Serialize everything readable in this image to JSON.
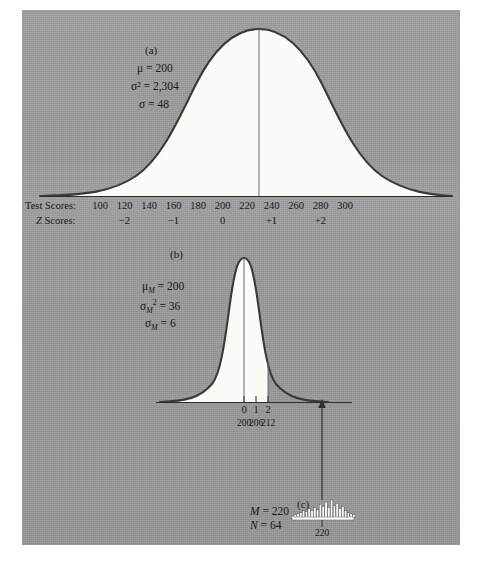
{
  "figure": {
    "background_color": "#9b9b9b",
    "curve_color": "#3a3a3a",
    "fill_color": "#fbfbf7",
    "text_color": "#16181a"
  },
  "panel_a": {
    "letter": "(a)",
    "stats": [
      {
        "symbol": "μ",
        "value": "200",
        "text": "μ = 200"
      },
      {
        "symbol": "σ²",
        "value": "2,304",
        "text": "σ² = 2,304"
      },
      {
        "symbol": "σ",
        "value": "48",
        "text": "σ = 48"
      }
    ],
    "axis_labels": {
      "raw": "Test Scores:",
      "z": "Z Scores:"
    },
    "test_scores": [
      "100",
      "120",
      "140",
      "160",
      "180",
      "200",
      "220",
      "240",
      "260",
      "280",
      "300"
    ],
    "z_scores": [
      "−2",
      "−1",
      "0",
      "+1",
      "+2"
    ]
  },
  "panel_b": {
    "letter": "(b)",
    "stats": [
      {
        "text": "μM = 200"
      },
      {
        "text": "σ²M = 36"
      },
      {
        "text": "σM = 6"
      }
    ],
    "z_scores": [
      "0",
      "1",
      "2"
    ],
    "raw_scores": [
      "200",
      "206",
      "212"
    ]
  },
  "panel_c": {
    "letter": "(c)",
    "stats": [
      {
        "text": "M = 220"
      },
      {
        "text": "N = 64"
      }
    ],
    "axis_label": "220",
    "histogram_heights": [
      2,
      3,
      4,
      6,
      5,
      8,
      6,
      9,
      7,
      12,
      10,
      14,
      9,
      16,
      11,
      13,
      8,
      10,
      6,
      4,
      3,
      2
    ]
  },
  "chart_data": {
    "type": "line",
    "title": "",
    "panels": [
      {
        "id": "a",
        "label": "(a)",
        "distribution": "normal",
        "mean": 200,
        "variance": 2304,
        "sd": 48,
        "x_axis_raw": {
          "label": "Test Scores:",
          "ticks": [
            100,
            120,
            140,
            160,
            180,
            200,
            220,
            240,
            260,
            280,
            300
          ]
        },
        "x_axis_z": {
          "label": "Z Scores:",
          "ticks": [
            -2,
            -1,
            0,
            1,
            2
          ]
        },
        "shaded": "full",
        "grid": false
      },
      {
        "id": "b",
        "label": "(b)",
        "distribution": "normal",
        "description": "distribution of means",
        "mean": 200,
        "variance": 36,
        "sd": 6,
        "x_axis_z": {
          "ticks": [
            0,
            1,
            2
          ]
        },
        "x_axis_raw": {
          "ticks": [
            200,
            206,
            212
          ]
        },
        "shaded_region": {
          "from_z": "-inf",
          "to_z": 2
        },
        "grid": false
      },
      {
        "id": "c",
        "label": "(c)",
        "type": "histogram",
        "sample_mean": 220,
        "sample_size": 64,
        "x_axis_raw": {
          "ticks": [
            220
          ]
        },
        "bar_heights": [
          2,
          3,
          4,
          6,
          5,
          8,
          6,
          9,
          7,
          12,
          10,
          14,
          9,
          16,
          11,
          13,
          8,
          10,
          6,
          4,
          3,
          2
        ],
        "grid": false
      }
    ],
    "annotations": [
      {
        "type": "arrow",
        "from_panel": "c",
        "to_panel": "b",
        "meaning": "sample mean located on distribution of means"
      }
    ]
  }
}
